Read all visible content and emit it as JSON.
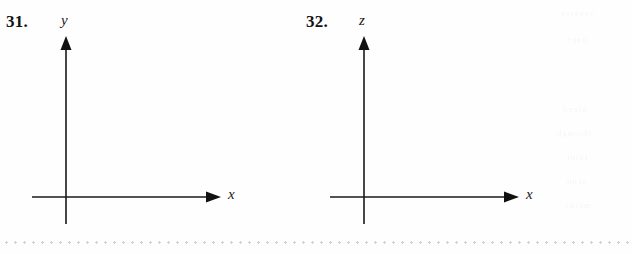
{
  "page": {
    "background_color": "#fefefe",
    "ink_color": "#1a1a1a",
    "separator_color": "#c9c9cf",
    "width": 632,
    "height": 254
  },
  "exercises": [
    {
      "number": "31.",
      "name": "exercise-31",
      "vertical_axis_label": "y",
      "horizontal_axis_label": "x",
      "origin": {
        "x": 66,
        "y": 197
      },
      "vertical_axis": {
        "top_y": 36,
        "bottom_y": 224
      },
      "horizontal_axis": {
        "left_x": 32,
        "right_x": 221
      }
    },
    {
      "number": "32.",
      "name": "exercise-32",
      "vertical_axis_label": "z",
      "horizontal_axis_label": "x",
      "origin": {
        "x": 64,
        "y": 197
      },
      "vertical_axis": {
        "top_y": 36,
        "bottom_y": 224
      },
      "horizontal_axis": {
        "left_x": 30,
        "right_x": 219
      }
    }
  ],
  "separator": {
    "style": "dotted",
    "label": "page-section-separator"
  },
  "ghosts": [
    {
      "text": "reverse",
      "left": 560,
      "top": 8
    },
    {
      "text": "page",
      "left": 566,
      "top": 34
    },
    {
      "text": "bleed",
      "left": 562,
      "top": 104
    },
    {
      "text": "through",
      "left": 556,
      "top": 128
    },
    {
      "text": "faint",
      "left": 566,
      "top": 152
    },
    {
      "text": "scan",
      "left": 566,
      "top": 176
    },
    {
      "text": "marks",
      "left": 564,
      "top": 200
    }
  ]
}
